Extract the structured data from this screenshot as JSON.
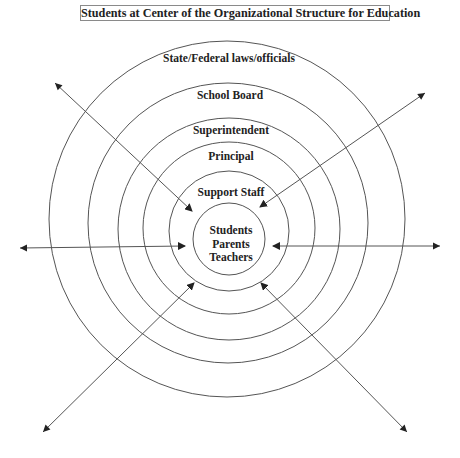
{
  "title": "Students at Center of the Organizational Structure for Education",
  "rings": [
    {
      "label": "State/Federal laws/officials",
      "cx": 227,
      "cy": 219,
      "r": 178,
      "label_y": 62
    },
    {
      "label": "School Board",
      "cx": 228,
      "cy": 223,
      "r": 140,
      "label_y": 99
    },
    {
      "label": "Superintendent",
      "cx": 229,
      "cy": 229,
      "r": 111,
      "label_y": 134
    },
    {
      "label": "Principal",
      "cx": 229,
      "cy": 228,
      "r": 86,
      "label_y": 160
    },
    {
      "label": "Support Staff",
      "cx": 229,
      "cy": 231,
      "r": 60,
      "label_y": 196
    },
    {
      "label": "",
      "cx": 229,
      "cy": 239,
      "r": 36,
      "label_y": 0
    }
  ],
  "center": {
    "lines": [
      "Students",
      "Parents",
      "Teachers"
    ]
  },
  "arrows": [
    {
      "name": "top-left",
      "x1": 55,
      "y1": 83,
      "x2": 192,
      "y2": 211
    },
    {
      "name": "top-right",
      "x1": 425,
      "y1": 93,
      "x2": 260,
      "y2": 207
    },
    {
      "name": "left",
      "x1": 20,
      "y1": 248,
      "x2": 185,
      "y2": 246
    },
    {
      "name": "right",
      "x1": 440,
      "y1": 246,
      "x2": 273,
      "y2": 246
    },
    {
      "name": "bottom-left",
      "x1": 43,
      "y1": 432,
      "x2": 194,
      "y2": 283
    },
    {
      "name": "bottom-right",
      "x1": 407,
      "y1": 432,
      "x2": 261,
      "y2": 283
    }
  ],
  "colors": {
    "line": "#555555",
    "text": "#222222",
    "background": "#ffffff"
  }
}
